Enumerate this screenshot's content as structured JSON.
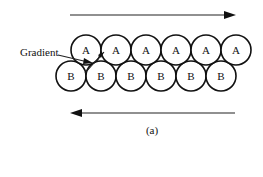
{
  "diagram": {
    "caption": "(a)",
    "gradient_label": "Gradient",
    "colors": {
      "stroke": "#111111",
      "background": "#ffffff"
    },
    "layer_a": {
      "label": "A",
      "count": 6,
      "circles": [
        {
          "label": "A"
        },
        {
          "label": "A"
        },
        {
          "label": "A"
        },
        {
          "label": "A"
        },
        {
          "label": "A"
        },
        {
          "label": "A"
        }
      ]
    },
    "layer_b": {
      "label": "B",
      "count": 6,
      "circles": [
        {
          "label": "B"
        },
        {
          "label": "B"
        },
        {
          "label": "B"
        },
        {
          "label": "B"
        },
        {
          "label": "B"
        },
        {
          "label": "B"
        }
      ]
    },
    "arrows": {
      "top": {
        "direction": "right"
      },
      "bottom": {
        "direction": "left"
      }
    }
  }
}
